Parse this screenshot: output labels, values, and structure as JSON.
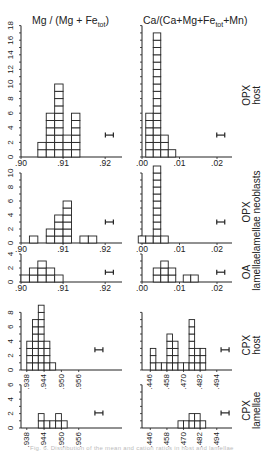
{
  "titles": {
    "left": "Mg / (Mg + Fe",
    "left_sub": "tot",
    "left_end": ")",
    "right": "Ca/(Ca+Mg+Fe",
    "right_sub": "tot",
    "right_end": "+Mn)"
  },
  "caption": "Fig. 6. Distribution of the mean and cation ratios in host and lamellae",
  "chart_data": {
    "type": "bar",
    "panels": [
      {
        "label": [
          "OPX",
          "host"
        ],
        "ymax": 18,
        "ytick_step": 2,
        "ytick_labels": [
          "0",
          "2",
          "4",
          "6",
          "8",
          "10",
          "12",
          "14",
          "16",
          "18"
        ],
        "left": {
          "xlabel_ticks": [
            ".90",
            ".91",
            ".92"
          ],
          "xrange": [
            0.9,
            0.924
          ],
          "bin_width": 0.002,
          "bins": [
            0.905,
            0.907,
            0.909,
            0.911,
            0.913
          ],
          "counts": [
            2,
            6,
            10,
            3,
            6
          ],
          "error_bar_x": 0.921
        },
        "right": {
          "xlabel_ticks": [
            ".00",
            ".01",
            ".02"
          ],
          "xrange": [
            0.0,
            0.024
          ],
          "bin_width": 0.002,
          "bins": [
            0.002,
            0.004,
            0.006,
            0.008
          ],
          "counts": [
            6,
            17,
            3,
            1
          ],
          "error_bar_x": 0.021
        }
      },
      {
        "label": [
          "OPX",
          "lamellae neoblasts"
        ],
        "ymax": 10,
        "ytick_step": 2,
        "ytick_labels": [
          "0",
          "2",
          "4",
          "6",
          "8",
          "10"
        ],
        "left": {
          "xlabel_ticks": [
            ".90",
            ".91",
            ".92"
          ],
          "xrange": [
            0.9,
            0.924
          ],
          "bin_width": 0.002,
          "bins": [
            0.903,
            0.907,
            0.909,
            0.911,
            0.915,
            0.917
          ],
          "counts": [
            1,
            2,
            4,
            6,
            1,
            1
          ],
          "error_bar_x": 0.921
        },
        "right": {
          "xlabel_ticks": [
            ".00",
            ".01",
            ".02"
          ],
          "xrange": [
            0.0,
            0.024
          ],
          "bin_width": 0.002,
          "bins": [
            0.0,
            0.002,
            0.004,
            0.006
          ],
          "counts": [
            1,
            1,
            11,
            1
          ],
          "error_bar_x": 0.021
        }
      },
      {
        "label": [
          "OA",
          "lamellae"
        ],
        "ymax": 4,
        "ytick_step": 2,
        "ytick_labels": [
          "0",
          "2",
          "4"
        ],
        "left": {
          "xlabel_ticks": [
            ".90",
            ".91",
            ".92"
          ],
          "xrange": [
            0.9,
            0.924
          ],
          "bin_width": 0.002,
          "bins": [
            0.901,
            0.903,
            0.905,
            0.907,
            0.909
          ],
          "counts": [
            1,
            2,
            3,
            2,
            1
          ],
          "error_bar_x": 0.921
        },
        "right": {
          "xlabel_ticks": [
            ".00",
            ".01",
            ".02"
          ],
          "xrange": [
            0.0,
            0.024
          ],
          "bin_width": 0.002,
          "bins": [
            0.004,
            0.006,
            0.008,
            0.012,
            0.014
          ],
          "counts": [
            2,
            3,
            2,
            1,
            1
          ],
          "error_bar_x": 0.021
        }
      },
      {
        "label": [
          "CPX",
          "host"
        ],
        "ymax": 8,
        "ytick_step": 2,
        "ytick_labels": [
          "0",
          "2",
          "4",
          "6",
          "8"
        ],
        "left": {
          "xlabel_ticks": [
            ".938",
            ".944",
            ".950",
            ".956"
          ],
          "xrange": [
            0.936,
            0.971
          ],
          "bin_width": 0.002,
          "bins": [
            0.939,
            0.941,
            0.943,
            0.945,
            0.947
          ],
          "counts": [
            4,
            7,
            9,
            4,
            1
          ],
          "error_bar_x": 0.963
        },
        "right": {
          "xlabel_ticks": [
            ".446",
            ".458",
            ".470",
            ".482",
            ".494"
          ],
          "xrange": [
            0.44,
            0.505
          ],
          "bin_width": 0.004,
          "bins": [
            0.448,
            0.452,
            0.456,
            0.46,
            0.464,
            0.468,
            0.472,
            0.476,
            0.48,
            0.484
          ],
          "counts": [
            3,
            1,
            1,
            5,
            4,
            1,
            1,
            7,
            3,
            3
          ],
          "error_bar_x": 0.5
        }
      },
      {
        "label": [
          "CPX",
          "lamellae"
        ],
        "ymax": 6,
        "ytick_step": 2,
        "ytick_labels": [
          "0",
          "2",
          "4",
          "6"
        ],
        "left": {
          "xlabel_ticks": [
            ".938",
            ".944",
            ".950",
            ".956"
          ],
          "xrange": [
            0.936,
            0.971
          ],
          "bin_width": 0.002,
          "bins": [
            0.943,
            0.945,
            0.947,
            0.949,
            0.951
          ],
          "counts": [
            2,
            1,
            1,
            2,
            1
          ],
          "error_bar_x": 0.963
        },
        "right": {
          "xlabel_ticks": [
            ".446",
            ".458",
            ".470",
            ".482",
            ".494"
          ],
          "xrange": [
            0.44,
            0.505
          ],
          "bin_width": 0.004,
          "bins": [
            0.468,
            0.472,
            0.476,
            0.48,
            0.484
          ],
          "counts": [
            1,
            1,
            2,
            2,
            1
          ],
          "error_bar_x": 0.5
        }
      }
    ]
  }
}
